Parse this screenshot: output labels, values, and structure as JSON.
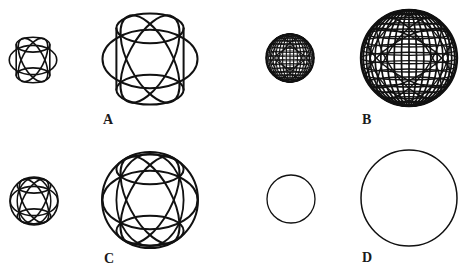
{
  "figure": {
    "width": 473,
    "height": 273,
    "background": "#ffffff",
    "stroke_color": "#111111",
    "label_color": "#1a1a1a"
  },
  "panels": [
    {
      "id": "A",
      "label": "A",
      "label_pos": [
        103,
        124
      ],
      "style": "rings",
      "outer_circle": false,
      "spheres": [
        {
          "size": "small",
          "cx": 33,
          "cy": 60,
          "r": 24,
          "stroke_width": 1.6
        },
        {
          "size": "large",
          "cx": 150,
          "cy": 59,
          "r": 48,
          "stroke_width": 2.0
        }
      ]
    },
    {
      "id": "B",
      "label": "B",
      "label_pos": [
        362,
        124
      ],
      "style": "wireframe",
      "outer_circle": true,
      "spheres": [
        {
          "size": "small",
          "cx": 290,
          "cy": 58,
          "r": 24,
          "stroke_width": 1.1
        },
        {
          "size": "large",
          "cx": 409,
          "cy": 58,
          "r": 48,
          "stroke_width": 1.7
        }
      ]
    },
    {
      "id": "C",
      "label": "C",
      "label_pos": [
        104,
        263
      ],
      "style": "rings",
      "outer_circle": true,
      "spheres": [
        {
          "size": "small",
          "cx": 34,
          "cy": 201,
          "r": 24,
          "stroke_width": 1.6
        },
        {
          "size": "large",
          "cx": 150,
          "cy": 200,
          "r": 48,
          "stroke_width": 2.0
        }
      ]
    },
    {
      "id": "D",
      "label": "D",
      "label_pos": [
        362,
        262
      ],
      "style": "circle",
      "outer_circle": true,
      "spheres": [
        {
          "size": "small",
          "cx": 291,
          "cy": 199,
          "r": 24,
          "stroke_width": 1.3
        },
        {
          "size": "large",
          "cx": 409,
          "cy": 198,
          "r": 48,
          "stroke_width": 1.5
        }
      ]
    }
  ]
}
